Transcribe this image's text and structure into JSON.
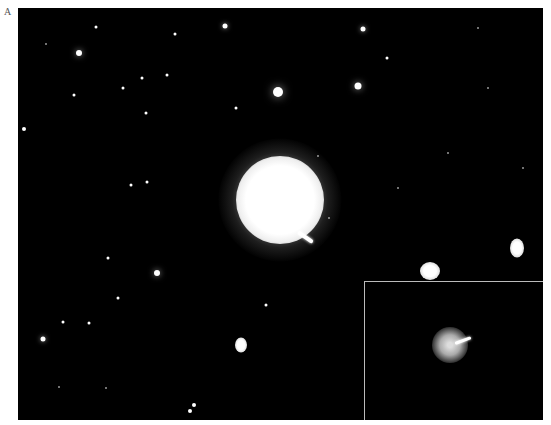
{
  "figure": {
    "panel_label": "A",
    "colors": {
      "background": "#000000",
      "page": "#ffffff",
      "inset_border": "#bbbbbb"
    }
  },
  "main_galaxy": {
    "x": 262,
    "y": 192,
    "size": 88
  },
  "jet": {
    "x": 280,
    "y": 222,
    "length": 18,
    "angle": 35
  },
  "ellipticals": [
    {
      "x": 412,
      "y": 263,
      "w": 20,
      "h": 18
    },
    {
      "x": 499,
      "y": 240,
      "w": 14,
      "h": 19
    },
    {
      "x": 223,
      "y": 337,
      "w": 12,
      "h": 15
    }
  ],
  "stars": [
    {
      "x": 61,
      "y": 45,
      "s": 6
    },
    {
      "x": 207,
      "y": 18,
      "s": 5
    },
    {
      "x": 345,
      "y": 21,
      "s": 5
    },
    {
      "x": 260,
      "y": 84,
      "s": 10
    },
    {
      "x": 340,
      "y": 78,
      "s": 7
    },
    {
      "x": 218,
      "y": 100,
      "s": 3
    },
    {
      "x": 369,
      "y": 50,
      "s": 3
    },
    {
      "x": 105,
      "y": 80,
      "s": 3
    },
    {
      "x": 124,
      "y": 70,
      "s": 3
    },
    {
      "x": 6,
      "y": 121,
      "s": 4
    },
    {
      "x": 113,
      "y": 177,
      "s": 3
    },
    {
      "x": 139,
      "y": 265,
      "s": 6
    },
    {
      "x": 25,
      "y": 331,
      "s": 5
    },
    {
      "x": 45,
      "y": 314,
      "s": 3
    },
    {
      "x": 71,
      "y": 315,
      "s": 3
    },
    {
      "x": 176,
      "y": 397,
      "s": 4
    },
    {
      "x": 172,
      "y": 403,
      "s": 4
    },
    {
      "x": 248,
      "y": 297,
      "s": 3
    },
    {
      "x": 129,
      "y": 174,
      "s": 3
    },
    {
      "x": 128,
      "y": 105,
      "s": 3
    },
    {
      "x": 78,
      "y": 19,
      "s": 3
    },
    {
      "x": 157,
      "y": 26,
      "s": 3
    },
    {
      "x": 149,
      "y": 67,
      "s": 3
    },
    {
      "x": 90,
      "y": 250,
      "s": 3
    },
    {
      "x": 100,
      "y": 290,
      "s": 3
    },
    {
      "x": 56,
      "y": 87,
      "s": 3
    },
    {
      "x": 28,
      "y": 36,
      "s": 2
    },
    {
      "x": 300,
      "y": 148,
      "s": 2
    },
    {
      "x": 311,
      "y": 210,
      "s": 2
    },
    {
      "x": 430,
      "y": 145,
      "s": 2
    },
    {
      "x": 470,
      "y": 80,
      "s": 2
    },
    {
      "x": 505,
      "y": 160,
      "s": 2
    },
    {
      "x": 380,
      "y": 180,
      "s": 2
    },
    {
      "x": 88,
      "y": 380,
      "s": 2
    },
    {
      "x": 41,
      "y": 379,
      "s": 2
    },
    {
      "x": 460,
      "y": 20,
      "s": 2
    }
  ],
  "inset": {
    "galaxy": {
      "x": 85,
      "y": 63,
      "size": 36
    },
    "jet": {
      "x": 90,
      "y": 60,
      "length": 17,
      "angle": -20
    }
  }
}
